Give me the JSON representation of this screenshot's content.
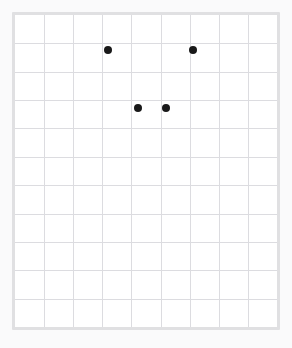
{
  "figure": {
    "title": "",
    "background_color": "#fafafb",
    "panel_background": "#ffffff",
    "border_color": "#e0e0e2",
    "grid_color": "#dcdce0",
    "point_color": "#191919"
  },
  "chart_data": {
    "type": "scatter",
    "title": "",
    "xlabel": "",
    "ylabel": "",
    "xlim": [
      0,
      9
    ],
    "ylim": [
      0,
      11
    ],
    "grid": true,
    "legend": null,
    "xticklabels": [],
    "yticklabels": [],
    "grid_columns": 9,
    "grid_rows": 11,
    "marker": "o",
    "marker_size": 8,
    "points": [
      {
        "label": "point-1",
        "x": 3,
        "y": 10,
        "px": 93,
        "py": 35
      },
      {
        "label": "point-2",
        "x": 6,
        "y": 10,
        "px": 178,
        "py": 35
      },
      {
        "label": "point-3",
        "x": 4,
        "y": 8,
        "px": 123,
        "py": 93
      },
      {
        "label": "point-4",
        "x": 5,
        "y": 8,
        "px": 151,
        "py": 93
      }
    ],
    "point_count": 4
  }
}
